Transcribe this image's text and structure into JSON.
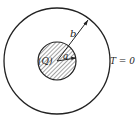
{
  "diagram": {
    "inner_region_label": "(Q)",
    "inner_radius_label": "a",
    "outer_radius_label": "b",
    "boundary_condition_label": "T = 0",
    "colors": {
      "stroke": "#222222",
      "background": "#ffffff",
      "hatch": "#333333"
    }
  }
}
